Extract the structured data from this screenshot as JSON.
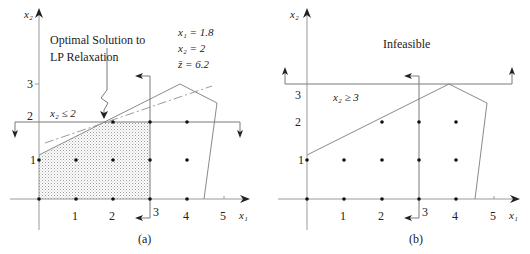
{
  "panels": [
    {
      "id": "a",
      "caption": "(a)",
      "axis_x_label": "x₁",
      "axis_y_label": "x₂",
      "x_ticks": [
        "1",
        "2",
        "3",
        "4",
        "5"
      ],
      "y_ticks": [
        "1",
        "2",
        "3"
      ],
      "constraint_label": "x₂ ≤ 2",
      "annotation": "Optimal Solution to LP Relaxation",
      "annotation_line1": "Optimal Solution to",
      "annotation_line2": "LP Relaxation",
      "solution": {
        "x1": "x₁ = 1.8",
        "x2": "x₂ = 2",
        "z": "z̄ = 6.2"
      },
      "feasible_region": "shaded (0≤x₁≤3, 0≤x₂≤2)",
      "lattice_points": [
        [
          0,
          0
        ],
        [
          1,
          0
        ],
        [
          2,
          0
        ],
        [
          3,
          0
        ],
        [
          4,
          0
        ],
        [
          0,
          1
        ],
        [
          1,
          1
        ],
        [
          2,
          1
        ],
        [
          3,
          1
        ],
        [
          4,
          1
        ],
        [
          2,
          2
        ],
        [
          3,
          2
        ],
        [
          4,
          2
        ]
      ]
    },
    {
      "id": "b",
      "caption": "(b)",
      "axis_x_label": "x₁",
      "axis_y_label": "x₂",
      "x_ticks": [
        "1",
        "2",
        "3",
        "4",
        "5"
      ],
      "y_ticks": [
        "1",
        "2",
        "3"
      ],
      "constraint_label": "x₂ ≥ 3",
      "region_label": "Infeasible",
      "lattice_points": [
        [
          0,
          0
        ],
        [
          1,
          0
        ],
        [
          2,
          0
        ],
        [
          3,
          0
        ],
        [
          4,
          0
        ],
        [
          0,
          1
        ],
        [
          1,
          1
        ],
        [
          2,
          1
        ],
        [
          3,
          1
        ],
        [
          4,
          1
        ],
        [
          2,
          2
        ],
        [
          3,
          2
        ],
        [
          4,
          2
        ]
      ]
    }
  ],
  "polygon_vertices": [
    [
      0,
      1.15
    ],
    [
      3.8,
      3
    ],
    [
      4.8,
      2.5
    ],
    [
      4.5,
      0
    ]
  ],
  "objective_direction": "dash-dot line through (1.8, 2)",
  "branch_cut": "x₁ ≤ 3 (vertical line with left arrow)"
}
